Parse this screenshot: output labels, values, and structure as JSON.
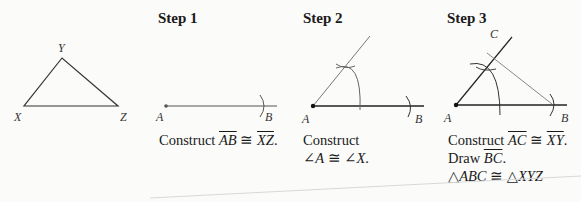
{
  "figure": {
    "given": {
      "vertices": {
        "X": "X",
        "Y": "Y",
        "Z": "Z"
      }
    },
    "steps": [
      {
        "title": "Step 1",
        "labels": {
          "A": "A",
          "B": "B"
        },
        "caption": {
          "prefix": "Construct ",
          "seg1": "AB",
          "rel": " ≅ ",
          "seg2": "XZ",
          "suffix": "."
        }
      },
      {
        "title": "Step 2",
        "labels": {
          "A": "A",
          "B": "B"
        },
        "caption": {
          "line1": "Construct",
          "line2_a": "∠",
          "line2_b": "A",
          "line2_rel": " ≅ ∠",
          "line2_c": "X",
          "line2_end": "."
        }
      },
      {
        "title": "Step 3",
        "labels": {
          "A": "A",
          "B": "B",
          "C": "C"
        },
        "caption": {
          "l1_prefix": "Construct ",
          "l1_seg1": "AC",
          "l1_rel": " ≅ ",
          "l1_seg2": "XY",
          "l1_suffix": ".",
          "l2_prefix": "Draw ",
          "l2_seg": "BC",
          "l2_suffix": ".",
          "l3_t1": "△",
          "l3_n1": "ABC",
          "l3_rel": " ≅ △",
          "l3_n2": "XYZ"
        }
      }
    ]
  }
}
